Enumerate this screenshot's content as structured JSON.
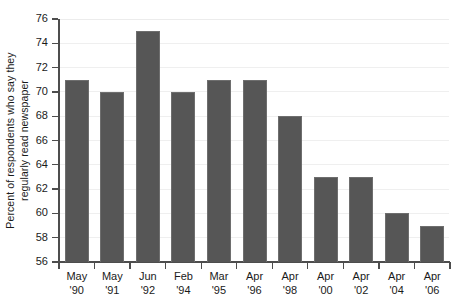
{
  "chart_data": {
    "type": "bar",
    "title": "",
    "xlabel": "",
    "ylabel": "Percent of respondents who say they regularly read newspaper",
    "ylabel_lines": [
      "Percent of respondents who say they",
      "regularly read newspaper"
    ],
    "categories": [
      "May '90",
      "May '91",
      "Jun '92",
      "Feb '94",
      "Mar '95",
      "Apr '96",
      "Apr '98",
      "Apr '00",
      "Apr '02",
      "Apr '04",
      "Apr '06"
    ],
    "category_lines": [
      [
        "May",
        "'90"
      ],
      [
        "May",
        "'91"
      ],
      [
        "Jun",
        "'92"
      ],
      [
        "Feb",
        "'94"
      ],
      [
        "Mar",
        "'95"
      ],
      [
        "Apr",
        "'96"
      ],
      [
        "Apr",
        "'98"
      ],
      [
        "Apr",
        "'00"
      ],
      [
        "Apr",
        "'02"
      ],
      [
        "Apr",
        "'04"
      ],
      [
        "Apr",
        "'06"
      ]
    ],
    "values": [
      71,
      70,
      75,
      70,
      71,
      71,
      68,
      63,
      63,
      60,
      59
    ],
    "ylim": [
      56,
      76
    ],
    "ytick_step": 2,
    "yticks": [
      56,
      58,
      60,
      62,
      64,
      66,
      68,
      70,
      72,
      74,
      76
    ],
    "ytick_labels": [
      "56",
      "58",
      "60",
      "62",
      "64",
      "66",
      "68",
      "70",
      "72",
      "74",
      "76"
    ],
    "grid": true,
    "grid_axis": "y",
    "legend": null,
    "legend_position": "none",
    "bar_color": "#565656",
    "bar_edge_color": "#6e6e6e",
    "grid_color": "#efefef",
    "axis_color": "#4d4d4d",
    "background_color": "#ffffff",
    "text_color": "#1a1a1a"
  }
}
